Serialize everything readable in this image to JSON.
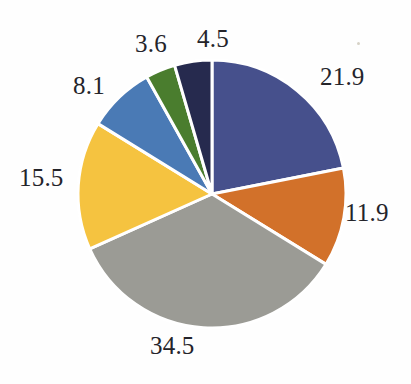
{
  "chart_data": {
    "type": "pie",
    "title": "",
    "subtitle": "",
    "xlabel": "",
    "ylabel": "",
    "legend": "none",
    "grid": false,
    "start_angle_deg": 0,
    "direction": "clockwise",
    "total": 100.0,
    "labels_show_values": true,
    "categories": [
      "21.9",
      "11.9",
      "34.5",
      "15.5",
      "8.1",
      "3.6",
      "4.5"
    ],
    "values": [
      21.9,
      11.9,
      34.5,
      15.5,
      8.1,
      3.6,
      4.5
    ],
    "colors": [
      "#46508c",
      "#d2712a",
      "#9b9b95",
      "#f5c340",
      "#4a7ab5",
      "#4a7d2e",
      "#262a4e"
    ],
    "slices": [
      {
        "label": "21.9",
        "value": 21.9,
        "color": "#46508c",
        "color_name": "indigo-blue"
      },
      {
        "label": "11.9",
        "value": 11.9,
        "color": "#d2712a",
        "color_name": "orange"
      },
      {
        "label": "34.5",
        "value": 34.5,
        "color": "#9b9b95",
        "color_name": "gray"
      },
      {
        "label": "15.5",
        "value": 15.5,
        "color": "#f5c340",
        "color_name": "gold"
      },
      {
        "label": "8.1",
        "value": 8.1,
        "color": "#4a7ab5",
        "color_name": "steel-blue"
      },
      {
        "label": "3.6",
        "value": 3.6,
        "color": "#4a7d2e",
        "color_name": "green"
      },
      {
        "label": "4.5",
        "value": 4.5,
        "color": "#262a4e",
        "color_name": "dark-navy"
      }
    ]
  },
  "geometry": {
    "center_x": 212,
    "center_y": 194,
    "radius": 134,
    "separator_color": "#ffffff",
    "separator_width": 3
  },
  "labels": {
    "slice_1": "21.9",
    "slice_2": "11.9",
    "slice_3": "34.5",
    "slice_4": "15.5",
    "slice_5": "8.1",
    "slice_6": "3.6",
    "slice_7": "4.5"
  },
  "canvas": {
    "background": "#fefefe",
    "text_color": "#24242a"
  }
}
